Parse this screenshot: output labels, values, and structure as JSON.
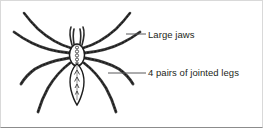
{
  "figure": {
    "view": "dorsal",
    "background_color": "#ffffff",
    "ink_color": "#231f20",
    "leader_line_color": "#58595b",
    "border_color": "#d9d9d9"
  },
  "labels": [
    {
      "id": "jaws",
      "text": "Large jaws",
      "leader": {
        "x1": 126,
        "y1": 34,
        "x2": 146,
        "y2": 34
      },
      "text_x": 148,
      "text_y": 29
    },
    {
      "id": "legs",
      "text": "4 pairs of jointed legs",
      "leader": {
        "x1": 108,
        "y1": 73,
        "x2": 146,
        "y2": 73
      },
      "text_x": 148,
      "text_y": 67
    }
  ],
  "anatomy": {
    "cephalothorax_label": "cephalothorax",
    "abdomen_label": "abdomen",
    "chelicerae_label": "chelicerae",
    "leg_count": 8,
    "leg_pair_count": 4
  }
}
